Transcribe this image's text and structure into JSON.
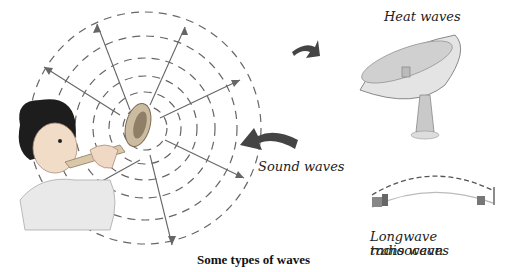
{
  "illustration": {
    "caption": "Some types of waves",
    "labels": {
      "heat": "Heat waves",
      "sound": "Sound waves",
      "radio_line1": "Longwave transocean",
      "radio_line2": "radio waves"
    },
    "colors": {
      "wave_lines": "#666666",
      "arrow_fill": "#444444",
      "text": "#222222"
    }
  }
}
